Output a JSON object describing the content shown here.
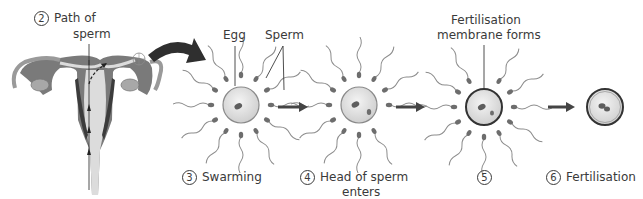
{
  "diagram": {
    "path_label": {
      "number": "2",
      "text_line1": "Path of",
      "text_line2": "sperm"
    },
    "callouts": {
      "egg": "Egg",
      "sperm": "Sperm",
      "membrane_line1": "Fertilisation",
      "membrane_line2": "membrane forms"
    },
    "stages": [
      {
        "number": "3",
        "label": "Swarming"
      },
      {
        "number": "4",
        "label_line1": "Head of sperm",
        "label_line2": "enters"
      },
      {
        "number": "5",
        "label": ""
      },
      {
        "number": "6",
        "label": "Fertilisation"
      }
    ],
    "colors": {
      "uterus_outer": "#7a7a7a",
      "uterus_inner": "#d9d9d9",
      "uterus_dark": "#3c3c3c",
      "egg_fill": "#e3e3e3",
      "egg_border": "#8a8a8a",
      "membrane": "#333333",
      "arrow": "#444444",
      "big_arrow": "#2f2f2f"
    }
  }
}
